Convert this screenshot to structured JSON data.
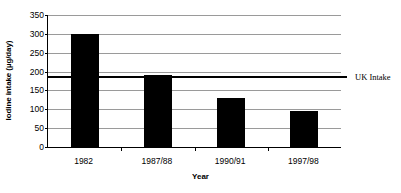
{
  "chart_data": {
    "type": "bar",
    "title": "",
    "subtitle": "",
    "xlabel": "Year",
    "ylabel": "Iodine intake (µg/day)",
    "categories": [
      "1982",
      "1987/88",
      "1990/91",
      "1997/98"
    ],
    "values": [
      300,
      190,
      130,
      95
    ],
    "series": [
      {
        "name": "Iodine intake",
        "values": [
          300,
          190,
          130,
          95
        ]
      }
    ],
    "ylim": [
      0,
      350
    ],
    "ytick_labels": [
      "0",
      "50",
      "100",
      "150",
      "200",
      "250",
      "300",
      "350"
    ],
    "ytick_values": [
      0,
      50,
      100,
      150,
      200,
      250,
      300,
      350
    ],
    "grid": true,
    "legend": false,
    "bar_color": "#000000",
    "gridline_color": "#9a9a9a",
    "axis_color": "#000000",
    "annotations": [
      {
        "name": "uk-intake-threshold",
        "label": "UK Intake",
        "value": 187,
        "orientation": "horizontal",
        "color": "#000000"
      }
    ]
  }
}
